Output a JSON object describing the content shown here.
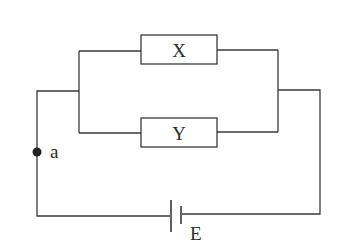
{
  "diagram": {
    "type": "circuit",
    "components": {
      "resistor_x": {
        "label": "X"
      },
      "resistor_y": {
        "label": "Y"
      },
      "battery": {
        "label": "E"
      },
      "node_a": {
        "label": "a"
      }
    },
    "colors": {
      "line": "#3a3a3a",
      "background": "#ffffff"
    }
  }
}
